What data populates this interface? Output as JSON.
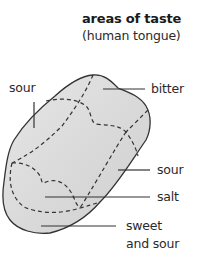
{
  "title": "areas of taste",
  "subtitle": "(human tongue)",
  "labels": {
    "sour_top": "sour",
    "bitter": "bitter",
    "sour_side": "sour",
    "salt": "salt",
    "sweet_line1": "sweet",
    "sweet_line2": "and sour"
  },
  "colors": {
    "tongue_fill": "#dcdcdc",
    "outline": "#333333",
    "text": "#2a2a2a"
  }
}
